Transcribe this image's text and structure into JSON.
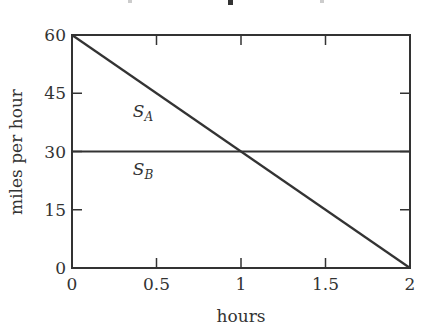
{
  "chart_data": {
    "type": "line",
    "title": "",
    "xlabel": "hours",
    "ylabel": "miles per hour",
    "xlim": [
      0,
      2
    ],
    "ylim": [
      0,
      60
    ],
    "x_ticks": [
      0,
      0.5,
      1,
      1.5,
      2
    ],
    "x_tick_labels": [
      "0",
      "0.5",
      "1",
      "1.5",
      "2"
    ],
    "y_ticks": [
      0,
      15,
      30,
      45,
      60
    ],
    "y_tick_labels": [
      "0",
      "15",
      "30",
      "45",
      "60"
    ],
    "grid": false,
    "legend": "inline labels",
    "series": [
      {
        "name": "S_A",
        "label_main": "S",
        "label_sub": "A",
        "x": [
          0,
          2
        ],
        "y": [
          60,
          0
        ]
      },
      {
        "name": "S_B",
        "label_main": "S",
        "label_sub": "B",
        "x": [
          0,
          2
        ],
        "y": [
          30,
          30
        ]
      }
    ],
    "annotations": [
      {
        "text": "S_A",
        "x": 0.42,
        "y": 39
      },
      {
        "text": "S_B",
        "x": 0.42,
        "y": 24
      }
    ],
    "line_color": "#333333"
  }
}
